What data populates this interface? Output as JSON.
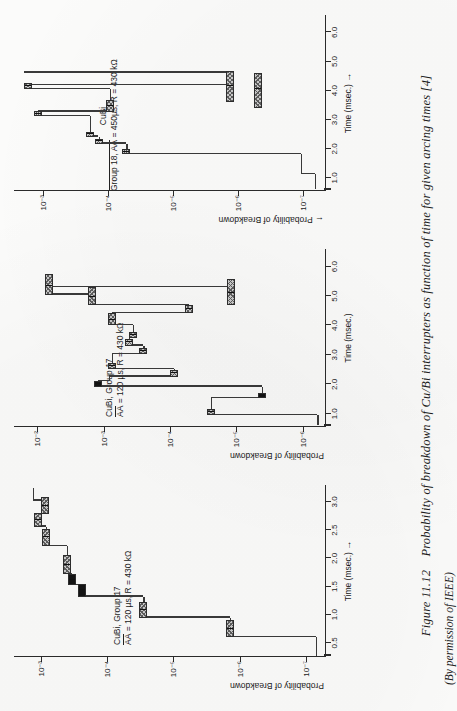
{
  "figure": {
    "number": "Figure 11.12",
    "caption": "Probability of breakdown of Cu/Bi interrupters as function of time for given arcing times [4]",
    "credit": "(By permission of IEEE)"
  },
  "chart_data": [
    {
      "id": "left",
      "type": "line",
      "title_line1": "CuBi, Group 17",
      "title_line2_pre": "AA",
      "title_line2_post": " = 120 µs, R = 430 kΩ",
      "xlabel": "Time (msec.)",
      "xlabel_arrow": "→",
      "ylabel": "Probability of Breakdown",
      "ylabel_arrow": "",
      "xlim": [
        0.25,
        3.3
      ],
      "xticks": [
        0.5,
        1.0,
        1.5,
        2.0,
        2.5,
        3.0
      ],
      "xticklabels": [
        "0.5",
        "1.0",
        "1.5",
        "2.0",
        "2.5",
        "3.0"
      ],
      "ylim_exp": [
        -7.3,
        -2.6
      ],
      "yticks_exp": [
        -3,
        -4,
        -5,
        -6,
        -7
      ],
      "yticklabels": [
        "10⁻³",
        "10⁻⁴",
        "10⁻⁵",
        "10⁻⁶",
        "10⁻⁷"
      ],
      "steps": [
        {
          "x0": 0.27,
          "x1": 0.6,
          "y_exp": -7.15
        },
        {
          "x0": 0.6,
          "x1": 0.95,
          "y_exp": -5.85
        },
        {
          "x0": 0.95,
          "x1": 1.32,
          "y_exp": -4.55
        },
        {
          "x0": 1.32,
          "x1": 1.52,
          "y_exp": -3.62
        },
        {
          "x0": 1.52,
          "x1": 1.72,
          "y_exp": -3.48
        },
        {
          "x0": 1.72,
          "x1": 2.22,
          "y_exp": -3.4
        },
        {
          "x0": 2.22,
          "x1": 2.56,
          "y_exp": -3.08
        },
        {
          "x0": 2.56,
          "x1": 2.78,
          "y_exp": -2.96
        },
        {
          "x0": 2.78,
          "x1": 3.02,
          "y_exp": -3.06
        },
        {
          "x0": 3.02,
          "x1": 3.25,
          "y_exp": -2.88
        }
      ],
      "bars": [
        {
          "x": 0.6,
          "y_exp": -5.85,
          "w_exp": 0.3,
          "fill": "hatch",
          "mark": 0.5
        },
        {
          "x": 0.95,
          "y_exp": -4.55,
          "w_exp": 0.28,
          "fill": "hatch",
          "mark": 0.5
        },
        {
          "x": 1.32,
          "y_exp": -3.62,
          "w_exp": 0.22,
          "fill": "solid",
          "mark": 0.5
        },
        {
          "x": 1.52,
          "y_exp": -3.48,
          "w_exp": 0.2,
          "fill": "solid",
          "mark": 0.5
        },
        {
          "x": 1.72,
          "y_exp": -3.4,
          "w_exp": 0.34,
          "fill": "hatch",
          "mark": 0.5
        },
        {
          "x": 2.22,
          "y_exp": -3.08,
          "w_exp": 0.3,
          "fill": "hatch",
          "mark": 0.5
        },
        {
          "x": 2.56,
          "y_exp": -2.96,
          "w_exp": 0.24,
          "fill": "hatch",
          "mark": 0.5
        },
        {
          "x": 2.78,
          "y_exp": -3.06,
          "w_exp": 0.3,
          "fill": "hatch",
          "mark": 0.5
        }
      ]
    },
    {
      "id": "middle",
      "type": "line",
      "title_line1": "CuBi, Group 17",
      "title_line2_pre": "AA",
      "title_line2_post": " = 120 µs, R = 430 kΩ",
      "xlabel": "Time (msec.)",
      "xlabel_arrow": "",
      "ylabel": "Probability of Breakdown",
      "ylabel_arrow": "",
      "xlim": [
        0.55,
        6.6
      ],
      "xticks": [
        1.0,
        2.0,
        3.0,
        4.0,
        5.0,
        6.0
      ],
      "xticklabels": [
        "1.0",
        "2.0",
        "3.0",
        "4.0",
        "5.0",
        "6.0"
      ],
      "ylim_exp": [
        -6.35,
        -1.65
      ],
      "yticks_exp": [
        -2,
        -3,
        -4,
        -5,
        -6
      ],
      "yticklabels": [
        "10⁻²",
        "10⁻³",
        "10⁻⁴",
        "10⁻⁵",
        "10⁻⁶"
      ],
      "steps": [
        {
          "x0": 0.62,
          "x1": 0.95,
          "y_exp": -6.22
        },
        {
          "x0": 0.95,
          "x1": 1.52,
          "y_exp": -4.62
        },
        {
          "x0": 1.52,
          "x1": 1.92,
          "y_exp": -5.38
        },
        {
          "x0": 1.92,
          "x1": 2.1,
          "y_exp": -2.92
        },
        {
          "x0": 2.1,
          "x1": 2.26,
          "y_exp": -3.08
        },
        {
          "x0": 2.26,
          "x1": 2.52,
          "y_exp": -4.06
        },
        {
          "x0": 2.52,
          "x1": 3.02,
          "y_exp": -3.12
        },
        {
          "x0": 3.02,
          "x1": 3.32,
          "y_exp": -3.6
        },
        {
          "x0": 3.32,
          "x1": 3.58,
          "y_exp": -3.38
        },
        {
          "x0": 3.58,
          "x1": 4.02,
          "y_exp": -3.44
        },
        {
          "x0": 4.02,
          "x1": 4.42,
          "y_exp": -3.12
        },
        {
          "x0": 4.42,
          "x1": 4.68,
          "y_exp": -4.28
        },
        {
          "x0": 4.68,
          "x1": 5.05,
          "y_exp": -2.82
        },
        {
          "x0": 5.05,
          "x1": 5.3,
          "y_exp": -2.18
        },
        {
          "x0": 5.3,
          "x1": 5.3,
          "y_exp": -4.92
        }
      ],
      "bars": [
        {
          "x": 0.95,
          "y_exp": -4.62,
          "w_exp": 0.22,
          "fill": "hatch",
          "mark": 0.5
        },
        {
          "x": 1.52,
          "y_exp": -5.38,
          "w_exp": 0.2,
          "fill": "solid",
          "mark": 0.5
        },
        {
          "x": 1.92,
          "y_exp": -2.92,
          "w_exp": 0.18,
          "fill": "solid",
          "mark": 0.5
        },
        {
          "x": 2.26,
          "y_exp": -4.06,
          "w_exp": 0.22,
          "fill": "hatch",
          "mark": 0.5
        },
        {
          "x": 2.52,
          "y_exp": -3.12,
          "w_exp": 0.22,
          "fill": "hatch",
          "mark": 0.5
        },
        {
          "x": 3.02,
          "y_exp": -3.6,
          "w_exp": 0.2,
          "fill": "hatch",
          "mark": 0.5
        },
        {
          "x": 3.32,
          "y_exp": -3.38,
          "w_exp": 0.22,
          "fill": "hatch",
          "mark": 0.5
        },
        {
          "x": 3.58,
          "y_exp": -3.44,
          "w_exp": 0.2,
          "fill": "hatch",
          "mark": 0.5
        },
        {
          "x": 4.02,
          "y_exp": -3.12,
          "w_exp": 0.4,
          "fill": "hatch",
          "mark": 0.45
        },
        {
          "x": 4.42,
          "y_exp": -4.28,
          "w_exp": 0.26,
          "fill": "hatch",
          "mark": 0.5
        },
        {
          "x": 4.68,
          "y_exp": -2.82,
          "w_exp": 0.62,
          "fill": "hatch",
          "mark": 0.45
        },
        {
          "x": 5.05,
          "y_exp": -2.18,
          "w_exp": 0.7,
          "fill": "hatch",
          "mark": 0.4
        },
        {
          "x": 4.68,
          "y_exp": -4.92,
          "w_exp": 0.9,
          "fill": "hatch",
          "mark": 0.45
        }
      ]
    },
    {
      "id": "right",
      "type": "line",
      "title_line1_pre": "CuBi",
      "title_line2_pre": "Group 18, AA",
      "title_line2_post": " = 450µs, R = 430 kΩ",
      "xlabel": "Time (msec.)",
      "xlabel_arrow": "→",
      "ylabel": "Probability of Breakdown",
      "ylabel_arrow": "←",
      "xlim": [
        0.55,
        6.6
      ],
      "xticks": [
        1.0,
        2.0,
        3.0,
        4.0,
        5.0,
        6.0
      ],
      "xticklabels": [
        "1.0",
        "2.0",
        "3.0",
        "4.0",
        "5.0",
        "6.0"
      ],
      "ylim_exp": [
        -7.35,
        -2.55
      ],
      "yticks_exp": [
        -3,
        -4,
        -5,
        -6,
        -7
      ],
      "yticklabels": [
        "10⁻³",
        "10⁻⁴",
        "10⁻⁵",
        "10⁻⁶",
        "10⁻⁷"
      ],
      "steps": [
        {
          "x0": 0.62,
          "x1": 1.12,
          "y_exp": -7.18
        },
        {
          "x0": 1.12,
          "x1": 1.82,
          "y_exp": -6.96
        },
        {
          "x0": 1.82,
          "x1": 2.18,
          "y_exp": -4.28
        },
        {
          "x0": 2.18,
          "x1": 2.42,
          "y_exp": -3.85
        },
        {
          "x0": 2.42,
          "x1": 3.12,
          "y_exp": -3.72
        },
        {
          "x0": 3.12,
          "x1": 3.28,
          "y_exp": -2.92
        },
        {
          "x0": 3.28,
          "x1": 4.05,
          "y_exp": -4.02
        },
        {
          "x0": 4.05,
          "x1": 4.18,
          "y_exp": -2.76
        },
        {
          "x0": 4.18,
          "x1": 4.62,
          "y_exp": -5.88
        },
        {
          "x0": 4.62,
          "x1": 4.62,
          "y_exp": -2.7
        }
      ],
      "bars": [
        {
          "x": 1.82,
          "y_exp": -4.28,
          "w_exp": 0.16,
          "fill": "hatch",
          "mark": 0.5
        },
        {
          "x": 2.18,
          "y_exp": -3.85,
          "w_exp": 0.16,
          "fill": "hatch",
          "mark": 0.5
        },
        {
          "x": 2.42,
          "y_exp": -3.72,
          "w_exp": 0.16,
          "fill": "hatch",
          "mark": 0.5
        },
        {
          "x": 3.12,
          "y_exp": -2.92,
          "w_exp": 0.16,
          "fill": "hatch",
          "mark": 0.5
        },
        {
          "x": 3.28,
          "y_exp": -4.02,
          "w_exp": 0.4,
          "fill": "hatch",
          "mark": 0.5
        },
        {
          "x": 4.05,
          "y_exp": -2.76,
          "w_exp": 0.22,
          "fill": "hatch",
          "mark": 0.4
        },
        {
          "x": 3.62,
          "y_exp": -5.88,
          "w_exp": 1.05,
          "fill": "hatch",
          "mark": 0.5
        },
        {
          "x": 3.4,
          "y_exp": -6.3,
          "w_exp": 1.22,
          "fill": "hatch",
          "mark": 0.55
        }
      ]
    }
  ]
}
